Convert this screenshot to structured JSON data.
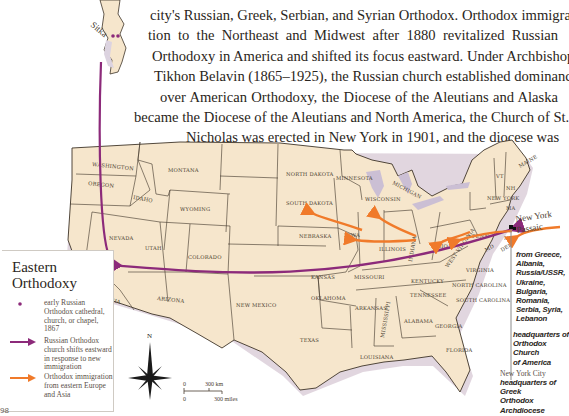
{
  "paragraph": {
    "lines": [
      "city's Russian, Greek, Serbian, and Syrian Orthodox. Orthodox immigra-",
      "tion to the Northeast and Midwest after 1880 revitalized Russian",
      "Orthodoxy in America and shifted its focus eastward. Under Archbishop",
      "Tikhon Belavin (1865–1925), the Russian church established dominance",
      "over American Orthodoxy, the Diocese of the Aleutians and Alaska",
      "became the Diocese of the Aleutians and North America, the Church of St.",
      "Nicholas was erected in New York in 1901, and the diocese was"
    ]
  },
  "map": {
    "colors": {
      "land": "#f6e6cc",
      "border": "#3e3428",
      "coast_shadow": "#c9b4c4",
      "water_lakes": "#cbbfd4",
      "russian_shift": "#8c2a7a",
      "immigration": "#f07a2a",
      "cathedral_dot": "#8c2a7a"
    },
    "states": [
      "WASHINGTON",
      "OREGON",
      "IDAHO",
      "MONTANA",
      "WYOMING",
      "NEVADA",
      "CALIFORNIA",
      "UTAH",
      "COLORADO",
      "ARIZONA",
      "NEW MEXICO",
      "NORTH DAKOTA",
      "SOUTH DAKOTA",
      "NEBRASKA",
      "KANSAS",
      "OKLAHOMA",
      "TEXAS",
      "MINNESOTA",
      "IOWA",
      "MISSOURI",
      "ARKANSAS",
      "LOUISIANA",
      "WISCONSIN",
      "ILLINOIS",
      "MICHIGAN",
      "INDIANA",
      "OHIO",
      "KENTUCKY",
      "TENNESSEE",
      "MISSISSIPPI",
      "ALABAMA",
      "GEORGIA",
      "FLORIDA",
      "SOUTH CAROLINA",
      "NORTH CAROLINA",
      "VIRGINIA",
      "WEST VIRGINIA",
      "PENN",
      "NEW YORK",
      "VT",
      "NH",
      "MAINE",
      "MA",
      "MD",
      "DEL",
      "NJ"
    ],
    "cities": {
      "sitka": "Sitka",
      "san_francisco_1": "San",
      "san_francisco_2": "Francisco",
      "new_york": "New York",
      "passaic": "Passaic"
    },
    "compass": {
      "north_label": "N"
    },
    "scale": {
      "km_zero": "0",
      "km_label": "300 km",
      "mi_zero": "0",
      "mi_label": "300 miles"
    }
  },
  "legend": {
    "title_line1": "Eastern",
    "title_line2": "Orthodoxy",
    "items": [
      {
        "symbol": "cathedral-dot",
        "label": "early Russian Orthodox cathedral, church, or chapel, 1867"
      },
      {
        "symbol": "purple-arrow",
        "label": "Russian Orthodox church shifts eastward in response to new immigration"
      },
      {
        "symbol": "orange-arrow",
        "label": "Orthodox immigration from eastern Europe and Asia"
      }
    ]
  },
  "callouts": {
    "origins": [
      "from Greece,",
      "Albania,",
      "Russia/USSR,",
      "Ukraine,",
      "Bulgaria,",
      "Romania,",
      "Serbia, Syria,",
      "Lebanon"
    ],
    "hq_oca": [
      "headquarters of",
      "Orthodox Church",
      "of America"
    ],
    "nyc_title": "New York City",
    "hq_greek": [
      "headquarters of Greek",
      "Orthodox Archdiocese",
      "of America"
    ]
  },
  "page": {
    "number": "98"
  }
}
